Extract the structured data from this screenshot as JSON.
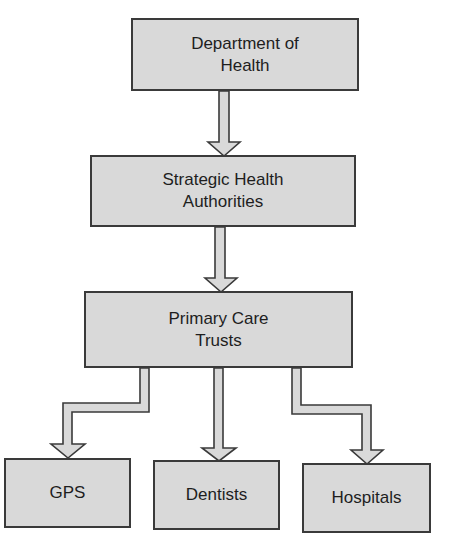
{
  "diagram": {
    "type": "hierarchy",
    "colors": {
      "box_fill": "#d9d9d9",
      "box_border": "#3a3a3a",
      "arrow_fill": "#d9d9d9",
      "arrow_stroke": "#3a3a3a",
      "text": "#1e1e1e",
      "background": "#ffffff"
    },
    "nodes": {
      "department_of_health": {
        "label": "Department of\nHealth"
      },
      "strategic_health_authorities": {
        "label": "Strategic Health\nAuthorities"
      },
      "primary_care_trusts": {
        "label": "Primary Care\nTrusts"
      },
      "gps": {
        "label": "GPS"
      },
      "dentists": {
        "label": "Dentists"
      },
      "hospitals": {
        "label": "Hospitals"
      }
    },
    "edges": [
      {
        "from": "department_of_health",
        "to": "strategic_health_authorities"
      },
      {
        "from": "strategic_health_authorities",
        "to": "primary_care_trusts"
      },
      {
        "from": "primary_care_trusts",
        "to": "gps"
      },
      {
        "from": "primary_care_trusts",
        "to": "dentists"
      },
      {
        "from": "primary_care_trusts",
        "to": "hospitals"
      }
    ]
  }
}
